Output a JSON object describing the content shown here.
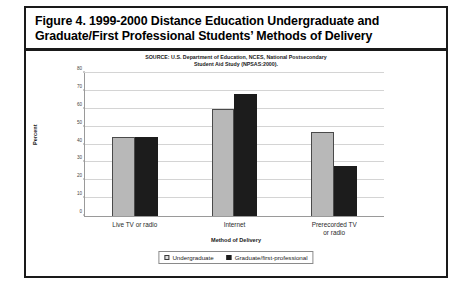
{
  "figure": {
    "title_line_1": "Figure 4.  1999-2000 Distance Education Undergraduate and",
    "title_line_2": "Graduate/First Professional Students’ Methods of Delivery",
    "source_line_1": "SOURCE: U.S. Department of Education, NCES, National Postsecondary",
    "source_line_2": "Student Aid Study (NPSAS:2000)."
  },
  "chart_data": {
    "type": "bar",
    "title": "",
    "categories": [
      "Live TV or radio",
      "Internet",
      "Prerecorded TV or radio"
    ],
    "series": [
      {
        "name": "Undergraduate",
        "values": [
          44,
          60,
          47
        ],
        "color": "#b8b8b8"
      },
      {
        "name": "Graduate/first-professional",
        "values": [
          44,
          68,
          28
        ],
        "color": "#1c1c1c"
      }
    ],
    "xlabel": "Method of Delivery",
    "ylabel": "Percent",
    "ylim": [
      0,
      80
    ],
    "yticks": [
      0,
      10,
      20,
      30,
      40,
      50,
      60,
      70,
      80
    ],
    "grid": true,
    "legend_position": "bottom"
  }
}
